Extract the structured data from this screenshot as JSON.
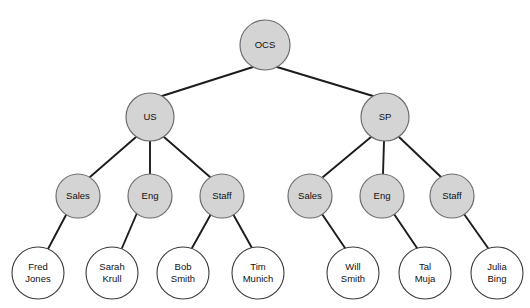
{
  "diagram": {
    "type": "organizational-tree",
    "title": "",
    "root_label": "OCS",
    "colors": {
      "internal_node_fill": "#d4d4d4",
      "internal_node_stroke": "#6e6e6e",
      "leaf_node_fill": "#ffffff",
      "leaf_node_stroke": "#3a3a3a",
      "edge": "#1c1c1c",
      "background": "#ffffff",
      "text": "#111111"
    }
  },
  "nodes": {
    "root": {
      "label": "OCS",
      "cx": 265,
      "cy": 45,
      "r": 25,
      "style": "filled"
    },
    "region_us": {
      "label": "US",
      "cx": 150,
      "cy": 117,
      "r": 24,
      "style": "filled"
    },
    "region_sp": {
      "label": "SP",
      "cx": 385,
      "cy": 117,
      "r": 24,
      "style": "filled"
    },
    "us_sales": {
      "label": "Sales",
      "cx": 78,
      "cy": 196,
      "r": 22,
      "style": "filled"
    },
    "us_eng": {
      "label": "Eng",
      "cx": 150,
      "cy": 196,
      "r": 22,
      "style": "filled"
    },
    "us_staff": {
      "label": "Staff",
      "cx": 222,
      "cy": 196,
      "r": 22,
      "style": "filled"
    },
    "sp_sales": {
      "label": "Sales",
      "cx": 310,
      "cy": 196,
      "r": 22,
      "style": "filled"
    },
    "sp_eng": {
      "label": "Eng",
      "cx": 382,
      "cy": 196,
      "r": 22,
      "style": "filled"
    },
    "sp_staff": {
      "label": "Staff",
      "cx": 452,
      "cy": 196,
      "r": 22,
      "style": "filled"
    },
    "p_fred": {
      "line1": "Fred",
      "line2": "Jones",
      "cx": 38,
      "cy": 273,
      "r": 26,
      "style": "open"
    },
    "p_sarah": {
      "line1": "Sarah",
      "line2": "Krull",
      "cx": 112,
      "cy": 273,
      "r": 26,
      "style": "open"
    },
    "p_bob": {
      "line1": "Bob",
      "line2": "Smith",
      "cx": 183,
      "cy": 273,
      "r": 26,
      "style": "open"
    },
    "p_tim": {
      "line1": "Tim",
      "line2": "Munich",
      "cx": 258,
      "cy": 273,
      "r": 26,
      "style": "open"
    },
    "p_will": {
      "line1": "Will",
      "line2": "Smith",
      "cx": 353,
      "cy": 273,
      "r": 26,
      "style": "open"
    },
    "p_tal": {
      "line1": "Tal",
      "line2": "Muja",
      "cx": 425,
      "cy": 273,
      "r": 26,
      "style": "open"
    },
    "p_julia": {
      "line1": "Julia",
      "line2": "Bing",
      "cx": 497,
      "cy": 273,
      "r": 26,
      "style": "open"
    }
  },
  "edges": [
    {
      "from": "root",
      "to": "region_us",
      "x1": 253,
      "y1": 67,
      "x2": 162,
      "y2": 96
    },
    {
      "from": "root",
      "to": "region_sp",
      "x1": 277,
      "y1": 67,
      "x2": 373,
      "y2": 96
    },
    {
      "from": "region_us",
      "to": "us_sales",
      "x1": 136,
      "y1": 137,
      "x2": 90,
      "y2": 177
    },
    {
      "from": "region_us",
      "to": "us_eng",
      "x1": 150,
      "y1": 141,
      "x2": 150,
      "y2": 174
    },
    {
      "from": "region_us",
      "to": "us_staff",
      "x1": 164,
      "y1": 137,
      "x2": 210,
      "y2": 177
    },
    {
      "from": "region_sp",
      "to": "sp_sales",
      "x1": 371,
      "y1": 137,
      "x2": 323,
      "y2": 177
    },
    {
      "from": "region_sp",
      "to": "sp_eng",
      "x1": 384,
      "y1": 141,
      "x2": 383,
      "y2": 174
    },
    {
      "from": "region_sp",
      "to": "sp_staff",
      "x1": 399,
      "y1": 137,
      "x2": 441,
      "y2": 177
    },
    {
      "from": "us_sales",
      "to": "p_fred",
      "x1": 66,
      "y1": 215,
      "x2": 48,
      "y2": 249
    },
    {
      "from": "us_eng",
      "to": "p_sarah",
      "x1": 137,
      "y1": 213,
      "x2": 122,
      "y2": 248
    },
    {
      "from": "us_staff",
      "to": "p_bob",
      "x1": 211,
      "y1": 214,
      "x2": 192,
      "y2": 248
    },
    {
      "from": "us_staff",
      "to": "p_tim",
      "x1": 233,
      "y1": 214,
      "x2": 252,
      "y2": 248
    },
    {
      "from": "sp_sales",
      "to": "p_will",
      "x1": 322,
      "y1": 214,
      "x2": 345,
      "y2": 248
    },
    {
      "from": "sp_eng",
      "to": "p_tal",
      "x1": 394,
      "y1": 214,
      "x2": 417,
      "y2": 248
    },
    {
      "from": "sp_staff",
      "to": "p_julia",
      "x1": 464,
      "y1": 214,
      "x2": 488,
      "y2": 248
    }
  ]
}
